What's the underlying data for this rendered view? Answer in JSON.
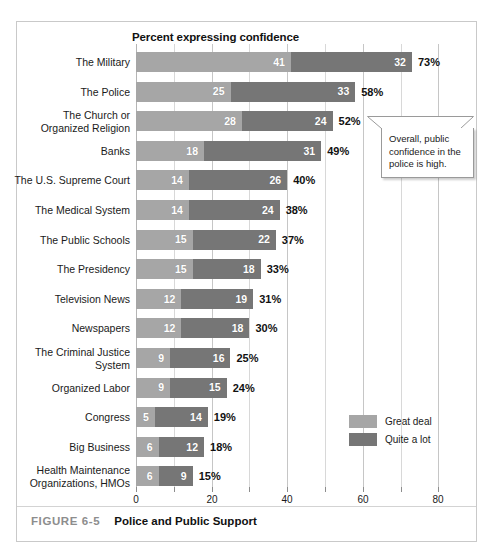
{
  "figure": {
    "number": "FIGURE 6-5",
    "title": "Police and Public Support"
  },
  "callout": {
    "text": "Overall, public confidence in the police is high."
  },
  "colors": {
    "great_deal": "#a6a6a6",
    "quite_a_lot": "#767676",
    "frame": "#c9c9c9",
    "gridline": "#c6c6c6",
    "caption_number": "#8d8d8d"
  },
  "chart_data": {
    "type": "bar",
    "orientation": "horizontal",
    "stacked": true,
    "title": "Percent expressing confidence",
    "xlabel": "",
    "ylabel": "",
    "xlim": [
      0,
      85
    ],
    "xticks": [
      0,
      10,
      20,
      30,
      40,
      50,
      60,
      70,
      80
    ],
    "xtick_labels": [
      "0",
      "",
      "20",
      "",
      "40",
      "",
      "60",
      "",
      "80"
    ],
    "grid": true,
    "legend_position": "bottom-right",
    "categories": [
      "The Military",
      "The Police",
      "The Church or\nOrganized Religion",
      "Banks",
      "The U.S. Supreme Court",
      "The Medical System",
      "The Public Schools",
      "The Presidency",
      "Television News",
      "Newspapers",
      "The Criminal Justice\nSystem",
      "Organized Labor",
      "Congress",
      "Big Business",
      "Health Maintenance\nOrganizations, HMOs"
    ],
    "series": [
      {
        "name": "Great deal",
        "color": "#a6a6a6",
        "values": [
          41,
          25,
          28,
          18,
          14,
          14,
          15,
          15,
          12,
          12,
          9,
          9,
          5,
          6,
          6
        ]
      },
      {
        "name": "Quite a lot",
        "color": "#767676",
        "values": [
          32,
          33,
          24,
          31,
          26,
          24,
          22,
          18,
          19,
          18,
          16,
          15,
          14,
          12,
          9
        ]
      }
    ],
    "totals": [
      "73%",
      "58%",
      "52%",
      "49%",
      "40%",
      "38%",
      "37%",
      "33%",
      "31%",
      "30%",
      "25%",
      "24%",
      "19%",
      "18%",
      "15%"
    ],
    "total_values": [
      73,
      58,
      52,
      49,
      40,
      38,
      37,
      33,
      31,
      30,
      25,
      24,
      19,
      18,
      15
    ]
  }
}
